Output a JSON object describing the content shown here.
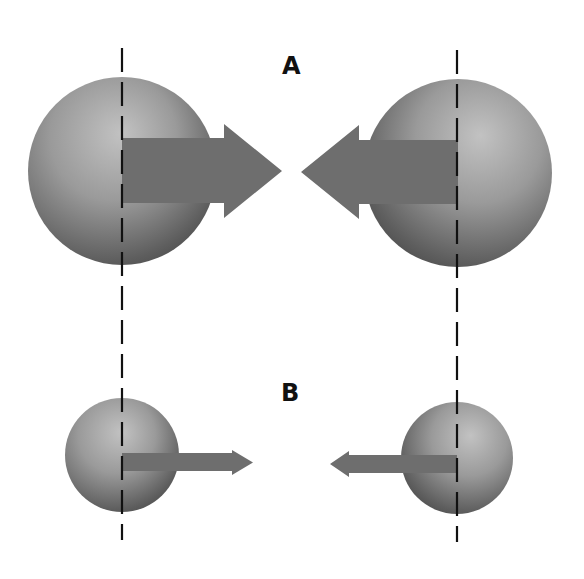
{
  "panels": [
    {
      "label": "A",
      "label_pos": [
        282,
        54
      ],
      "spheres": [
        {
          "cx": 122,
          "cy": 171,
          "r": 94,
          "arrow_dir": "right",
          "arrow": {
            "shaft_y1": 138,
            "shaft_y2": 203,
            "shaft_end": 224,
            "head_top": 124,
            "head_bottom": 218,
            "tip_x": 282
          }
        },
        {
          "cx": 458,
          "cy": 173,
          "r": 94,
          "arrow_dir": "left",
          "arrow": {
            "shaft_y1": 140,
            "shaft_y2": 204,
            "shaft_end": 359,
            "head_top": 125,
            "head_bottom": 219,
            "tip_x": 301
          }
        }
      ]
    },
    {
      "label": "B",
      "label_pos": [
        281,
        381
      ],
      "spheres": [
        {
          "cx": 122,
          "cy": 455,
          "r": 57,
          "arrow_dir": "right",
          "arrow": {
            "shaft_y1": 453,
            "shaft_y2": 471,
            "shaft_end": 232,
            "head_top": 450,
            "head_bottom": 475,
            "tip_x": 253
          }
        },
        {
          "cx": 457,
          "cy": 458,
          "r": 56,
          "arrow_dir": "left",
          "arrow": {
            "shaft_y1": 455,
            "shaft_y2": 473,
            "shaft_end": 349,
            "head_top": 451,
            "head_bottom": 477,
            "tip_x": 330
          }
        }
      ]
    }
  ],
  "axes": [
    {
      "x": 122,
      "y1": 48,
      "y2": 540
    },
    {
      "x": 457,
      "y1": 50,
      "y2": 542
    }
  ],
  "colors": {
    "background": "#ffffff",
    "sphere_light": "#bdbdbd",
    "sphere_mid": "#8f8f8f",
    "sphere_dark": "#4a4a4a",
    "arrow": "#6e6e6e",
    "axis": "#111111",
    "label": "#111111"
  }
}
